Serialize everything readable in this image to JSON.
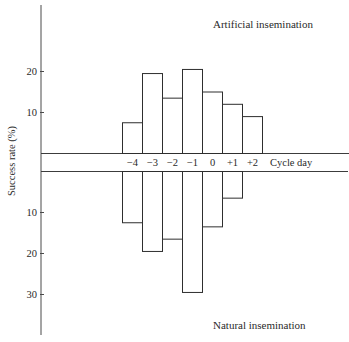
{
  "chart_data": {
    "type": "bar",
    "title": "",
    "xlabel": "Cycle day",
    "ylabel": "Success rate (%)",
    "categories": [
      "−4",
      "−3",
      "−2",
      "−1",
      "0",
      "+1",
      "+2"
    ],
    "series": [
      {
        "name": "Artificial insemination",
        "direction": "up",
        "values": [
          7.5,
          19.5,
          13.5,
          20.5,
          15,
          12,
          9
        ]
      },
      {
        "name": "Natural insemination",
        "direction": "down",
        "values": [
          12.5,
          19.5,
          16.5,
          29.5,
          13.5,
          6.5,
          null
        ]
      }
    ],
    "upper_yticks": [
      10,
      20
    ],
    "lower_yticks": [
      10,
      20,
      30
    ],
    "ylim_upper": [
      0,
      36
    ],
    "ylim_lower": [
      0,
      40
    ],
    "grid": false,
    "legend": "none (panel labels above and below)"
  },
  "labels": {
    "upper_panel": "Artificial insemination",
    "lower_panel": "Natural insemination",
    "x_axis": "Cycle day",
    "y_axis": "Success rate (%)"
  },
  "colors": {
    "background": "#ffffff",
    "line": "#2e2e2e",
    "text": "#2a2a2a"
  }
}
